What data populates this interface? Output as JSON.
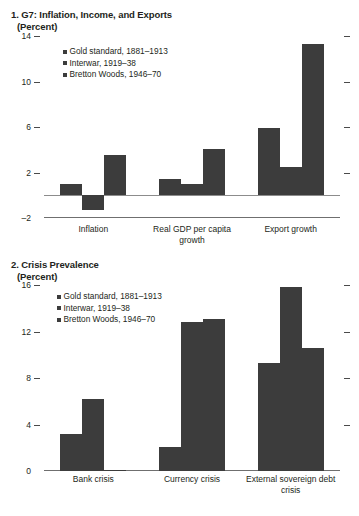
{
  "figure": {
    "background": "#ffffff",
    "bar_color": "#3c3c3c",
    "axis_color": "#6f6f6f"
  },
  "panel1": {
    "title": "1. G7: Inflation, Income, and Exports",
    "subtitle": "(Percent)",
    "legend": [
      {
        "label": "Gold standard, 1881–1913",
        "color": "#3c3c3c"
      },
      {
        "label": "Interwar, 1919–38",
        "color": "#3c3c3c"
      },
      {
        "label": "Bretton Woods, 1946–70",
        "color": "#3c3c3c"
      }
    ],
    "yticks": [
      "14",
      "10",
      "6",
      "2",
      "–2"
    ]
  },
  "panel2": {
    "title": "2. Crisis Prevalence",
    "subtitle": "(Percent)",
    "legend": [
      {
        "label": "Gold standard, 1881–1913",
        "color": "#3c3c3c"
      },
      {
        "label": "Interwar, 1919–38",
        "color": "#3c3c3c"
      },
      {
        "label": "Bretton Woods, 1946–70",
        "color": "#3c3c3c"
      }
    ],
    "yticks": [
      "16",
      "12",
      "8",
      "4",
      "0"
    ]
  },
  "chart_data": [
    {
      "type": "bar",
      "title": "1. G7: Inflation, Income, and Exports (Percent)",
      "xlabel": "",
      "ylabel": "Percent",
      "ylim": [
        -2,
        14
      ],
      "yticks": [
        -2,
        2,
        6,
        10,
        14
      ],
      "grid": false,
      "legend_position": "upper-left-inside",
      "categories": [
        "Inflation",
        "Real GDP per capita growth",
        "Export growth"
      ],
      "series": [
        {
          "name": "Gold standard, 1881–1913",
          "color": "#3c3c3c",
          "values": [
            1.0,
            1.4,
            5.9
          ]
        },
        {
          "name": "Interwar, 1919–38",
          "color": "#3c3c3c",
          "values": [
            -1.3,
            1.0,
            2.5
          ]
        },
        {
          "name": "Bretton Woods, 1946–70",
          "color": "#3c3c3c",
          "values": [
            3.5,
            4.1,
            13.3
          ]
        }
      ]
    },
    {
      "type": "bar",
      "title": "2. Crisis Prevalence (Percent)",
      "xlabel": "",
      "ylabel": "Percent",
      "ylim": [
        0,
        16
      ],
      "yticks": [
        0,
        4,
        8,
        12,
        16
      ],
      "grid": false,
      "legend_position": "upper-left-inside",
      "categories": [
        "Bank crisis",
        "Currency crisis",
        "External sovereign debt crisis"
      ],
      "series": [
        {
          "name": "Gold standard, 1881–1913",
          "color": "#3c3c3c",
          "values": [
            3.2,
            2.1,
            9.3
          ]
        },
        {
          "name": "Interwar, 1919–38",
          "color": "#3c3c3c",
          "values": [
            6.2,
            12.8,
            15.8
          ]
        },
        {
          "name": "Bretton Woods, 1946–70",
          "color": "#3c3c3c",
          "values": [
            0.12,
            13.1,
            10.6
          ]
        }
      ]
    }
  ]
}
